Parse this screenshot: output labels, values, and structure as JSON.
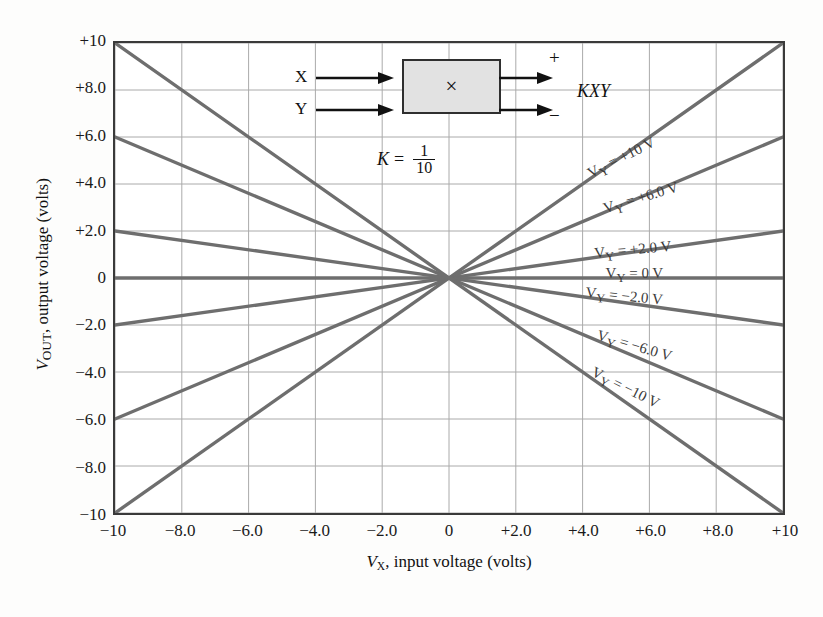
{
  "chart_data": {
    "type": "line",
    "title": "",
    "xlabel": "VX, input voltage (volts)",
    "ylabel": "VOUT, output voltage (volts)",
    "xlim": [
      -10,
      10
    ],
    "ylim": [
      -10,
      10
    ],
    "grid": true,
    "x": [
      -10,
      10
    ],
    "xticks": [
      "-10",
      "-8.0",
      "-6.0",
      "-4.0",
      "-2.0",
      "0",
      "+2.0",
      "+4.0",
      "+6.0",
      "+8.0",
      "+10"
    ],
    "xtick_values": [
      -10,
      -8,
      -6,
      -4,
      -2,
      0,
      2,
      4,
      6,
      8,
      10
    ],
    "yticks": [
      "+10",
      "+8.0",
      "+6.0",
      "+4.0",
      "+2.0",
      "0",
      "-2.0",
      "-4.0",
      "-6.0",
      "-8.0",
      "-10"
    ],
    "ytick_values": [
      10,
      8,
      6,
      4,
      2,
      0,
      -2,
      -4,
      -6,
      -8,
      -10
    ],
    "legend_position": "inline-right",
    "series": [
      {
        "name": "VY = +10 V",
        "vy": 10,
        "values": [
          -10,
          10
        ],
        "label": "V<sub>Y</sub> = +10 V",
        "label_x": 4.2,
        "label_angle": -26.5
      },
      {
        "name": "VY = +6.0 V",
        "vy": 6,
        "values": [
          -6,
          6
        ],
        "label": "V<sub>Y</sub> = +6.0 V",
        "label_x": 4.6,
        "label_angle": -16.5
      },
      {
        "name": "VY = +2.0 V",
        "vy": 2,
        "values": [
          -2,
          2
        ],
        "label": "V<sub>Y</sub> = +2.0 V",
        "label_x": 4.3,
        "label_angle": -5.5
      },
      {
        "name": "VY = 0 V",
        "vy": 0,
        "values": [
          0,
          0
        ],
        "label": "V<sub>Y</sub> = 0 V",
        "label_x": 4.6,
        "label_angle": 0
      },
      {
        "name": "VY = -2.0 V",
        "vy": -2,
        "values": [
          2,
          -2
        ],
        "label": "V<sub>Y</sub> = −2.0 V",
        "label_x": 4.0,
        "label_angle": 5.5
      },
      {
        "name": "VY = -6.0 V",
        "vy": -6,
        "values": [
          6,
          -6
        ],
        "label": "V<sub>Y</sub> = −6.0 V",
        "label_x": 4.3,
        "label_angle": 16.5
      },
      {
        "name": "VY = -10 V",
        "vy": -10,
        "values": [
          10,
          -10
        ],
        "label": "V<sub>Y</sub> = −10 V",
        "label_x": 4.1,
        "label_angle": 26.5
      }
    ],
    "annotations": {
      "k_label": "K",
      "k_equals": "=",
      "k_numerator": "1",
      "k_denominator": "10",
      "inset_input_x": "X",
      "inset_input_y": "Y",
      "inset_symbol": "×",
      "inset_output": "KXY",
      "inset_plus": "+",
      "inset_minus": "−"
    }
  },
  "colors": {
    "series_line": "#6e6e6e",
    "grid": "#a9a9a9",
    "frame": "#3a3a3a",
    "inset_fill": "#e2e2e2",
    "text": "#111111",
    "background": "#fdfdfc"
  }
}
